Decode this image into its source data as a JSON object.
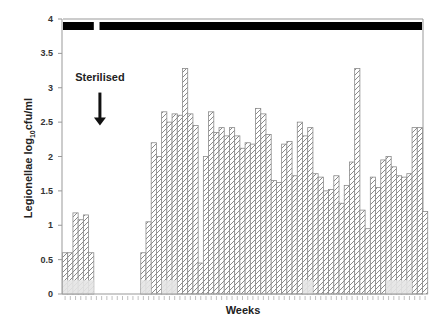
{
  "chart_data": {
    "type": "bar",
    "title": "",
    "xlabel": "Weeks",
    "ylabel_main": "Legionellae log",
    "ylabel_sub": "10",
    "ylabel_unit": "cfu/ml",
    "ylim": [
      0,
      4
    ],
    "yticks": [
      0,
      0.5,
      1,
      1.5,
      2,
      2.5,
      3,
      3.5,
      4
    ],
    "ytick_labels": [
      "0",
      "0.5",
      "1",
      "1.5",
      "2",
      "2.5",
      "3",
      "3.5",
      "4"
    ],
    "grid": false,
    "legend": "none",
    "num_weeks": 70,
    "series": [
      {
        "name": "Legionellae",
        "pattern": "diagonal-hatch",
        "values": [
          0.6,
          0.6,
          1.18,
          1.08,
          1.15,
          0.6,
          0,
          0,
          0,
          0,
          0,
          0,
          0,
          0,
          0,
          0.6,
          1.05,
          2.2,
          2.0,
          2.65,
          2.5,
          2.62,
          2.6,
          3.28,
          2.62,
          2.45,
          0.45,
          2.0,
          2.65,
          2.35,
          2.42,
          2.3,
          2.42,
          2.3,
          2.12,
          2.2,
          2.18,
          2.7,
          2.62,
          2.32,
          1.65,
          1.62,
          2.18,
          2.22,
          1.72,
          2.5,
          2.3,
          2.42,
          1.75,
          1.7,
          1.5,
          1.52,
          1.72,
          1.32,
          1.58,
          1.92,
          3.28,
          1.22,
          0.95,
          1.7,
          1.55,
          1.95,
          2.0,
          1.85,
          1.72,
          1.7,
          1.75,
          2.42,
          2.42,
          1.2
        ]
      }
    ],
    "shaded_base_value": 0.2,
    "shaded_base_weeks": [
      [
        0,
        5
      ],
      [
        15,
        16
      ],
      [
        19,
        21
      ],
      [
        46,
        47
      ],
      [
        62,
        66
      ]
    ],
    "treatment_periods": [
      {
        "start_week": 0,
        "end_week": 5
      },
      {
        "start_week": 7,
        "end_week": 69
      }
    ],
    "annotations": [
      {
        "text": "Sterilised",
        "type": "arrow-down",
        "week": 6.5,
        "y_text": 3.1,
        "y_arrow_top": 2.93,
        "y_arrow_bottom": 2.45
      }
    ],
    "colors": {
      "bar_fill": "#ffffff",
      "bar_stroke": "#8a8a8a",
      "hatch": "#8a8a8a",
      "base_fill": "#e4e4e4",
      "treatment_bar": "#000000",
      "axis": "#999999"
    }
  }
}
